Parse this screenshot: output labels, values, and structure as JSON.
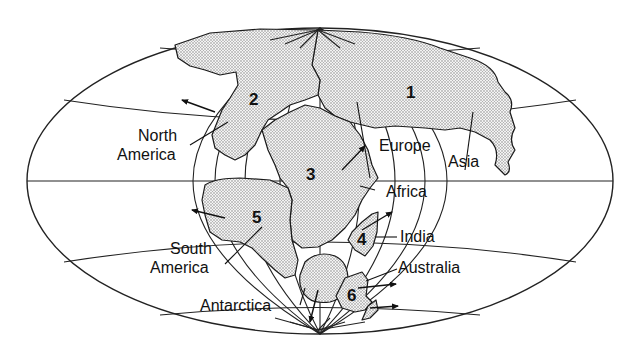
{
  "map": {
    "title": "",
    "projection": "oval (Mollweide-style) world projection showing supercontinent",
    "plates": [
      {
        "number": "1",
        "region": "Eurasia"
      },
      {
        "number": "2",
        "region": "North America"
      },
      {
        "number": "3",
        "region": "Africa"
      },
      {
        "number": "4",
        "region": "India"
      },
      {
        "number": "5",
        "region": "South America"
      },
      {
        "number": "6",
        "region": "Australia"
      }
    ],
    "labels": {
      "north_america_line1": "North",
      "north_america_line2": "America",
      "south_america_line1": "South",
      "south_america_line2": "America",
      "europe": "Europe",
      "asia": "Asia",
      "africa": "Africa",
      "india": "India",
      "australia": "Australia",
      "antarctica": "Antarctica"
    },
    "colors": {
      "ink": "#111111",
      "land_fill": "#d9d9d9",
      "background": "#ffffff"
    }
  }
}
